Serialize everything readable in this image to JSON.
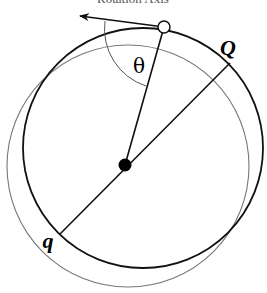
{
  "diagram": {
    "title": "Rotation Axis",
    "angle_label": "θ",
    "point_upper_label": "Q",
    "point_lower_label": "q",
    "colors": {
      "main_circle": "#111111",
      "shifted_circle": "#777777",
      "lines": "#111111",
      "angle_arc": "#555555"
    }
  }
}
